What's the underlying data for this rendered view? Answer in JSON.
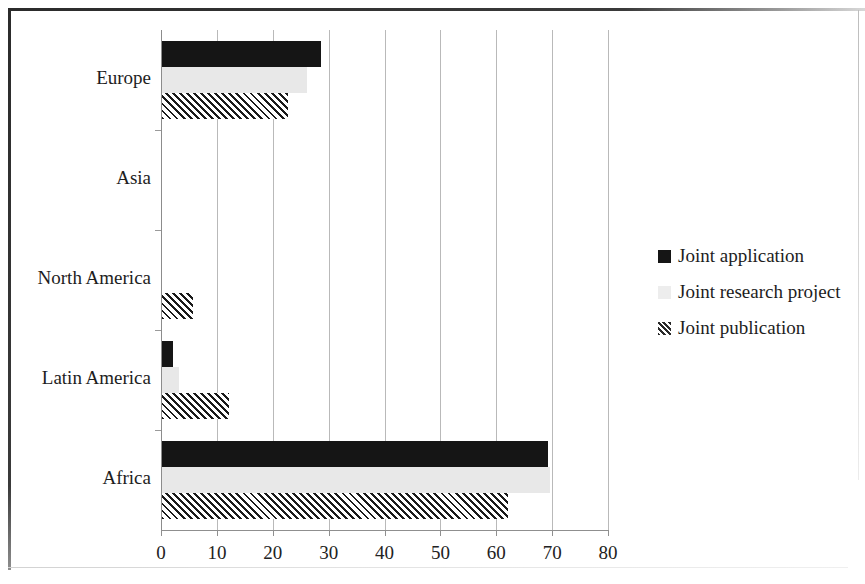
{
  "chart_data": {
    "type": "bar",
    "orientation": "horizontal",
    "title": "",
    "subtitle": "",
    "xlabel": "",
    "ylabel": "",
    "xlim": [
      0,
      80
    ],
    "xticks": [
      0,
      10,
      20,
      30,
      40,
      50,
      60,
      70,
      80
    ],
    "xtick_labels": [
      "0",
      "10",
      "20",
      "30",
      "40",
      "50",
      "60",
      "70",
      "80"
    ],
    "grid": "vertical",
    "legend_position": "right",
    "categories": [
      "Europe",
      "Asia",
      "North America",
      "Latin America",
      "Africa"
    ],
    "series": [
      {
        "name": "Joint application",
        "color": "#151515",
        "pattern": "solid",
        "values": [
          28.5,
          0,
          0,
          2,
          69
        ]
      },
      {
        "name": "Joint research project",
        "color": "#e8e8e8",
        "pattern": "solid-light",
        "values": [
          26,
          0,
          0,
          3,
          69.5
        ]
      },
      {
        "name": "Joint publication",
        "color": "#1a1a1a",
        "pattern": "diagonal-hatch",
        "values": [
          22.5,
          0,
          5.5,
          12,
          62
        ]
      }
    ]
  },
  "legend": {
    "items": [
      {
        "label": "Joint application",
        "key": "filled-square-black-icon"
      },
      {
        "label": "Joint research project",
        "key": "filled-square-lightgray-icon"
      },
      {
        "label": "Joint publication",
        "key": "hatched-square-icon"
      }
    ]
  }
}
